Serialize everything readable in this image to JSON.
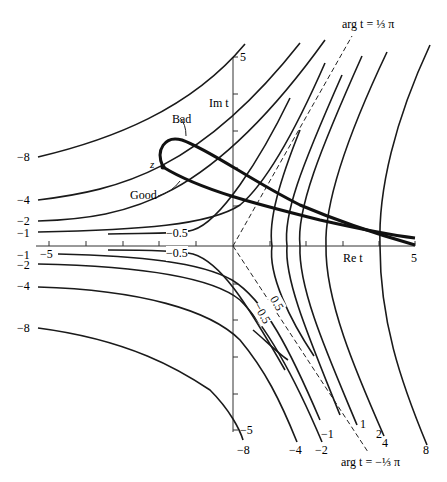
{
  "figure": {
    "axes": {
      "x_label": "Re t",
      "y_label": "Im t",
      "x_min_label": "−5",
      "x_max_label": "5",
      "y_max_label": "5",
      "y_min_label": "−5"
    },
    "asymptotes": {
      "upper": "arg t = ⅓ π",
      "lower": "arg t = −⅓ π"
    },
    "annotations": {
      "bad": "Bad",
      "good": "Good",
      "point": "z"
    },
    "left_labels_upper": [
      "−8",
      "−4",
      "−2",
      "−1"
    ],
    "left_labels_lower": [
      "−1",
      "−2",
      "−4",
      "−8"
    ],
    "inner_labels": [
      "−0.5",
      "−0.5",
      "0.5",
      "−0.5"
    ],
    "bottom_labels": [
      "−8",
      "−4",
      "−2",
      "−1",
      "1",
      "2",
      "4",
      "8"
    ]
  }
}
